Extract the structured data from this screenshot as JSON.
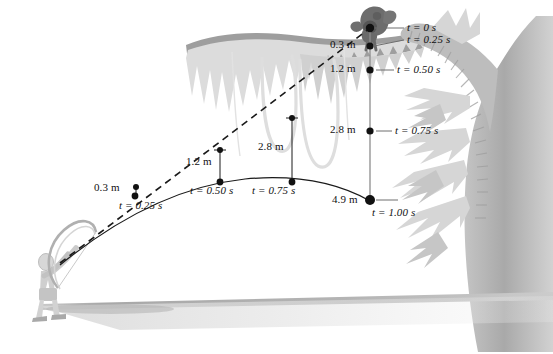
{
  "figure": {
    "ink_color": "#111111",
    "canopy_color": "#9a9a9a",
    "frond_color": "#d3d3d3",
    "trunk_color": "#b5b5b5",
    "ground_color": "#b9b9b9",
    "figure_color": "#c9c9c9",
    "monkey_color": "#6a6a6a",
    "vine_color": "#dcdcdc"
  },
  "monkey_drop": {
    "axis_label": "vertical fall of the monkey",
    "points": [
      {
        "distance": "",
        "time": "t = 0 s",
        "x": 370,
        "y": 28
      },
      {
        "distance": "0.3 m",
        "time": "t = 0.25 s",
        "x": 370,
        "y": 46
      },
      {
        "distance": "1.2 m",
        "time": "t = 0.50 s",
        "x": 370,
        "y": 70
      },
      {
        "distance": "2.8 m",
        "time": "t = 0.75 s",
        "x": 370,
        "y": 131
      },
      {
        "distance": "4.9 m",
        "time": "t = 1.00 s",
        "x": 370,
        "y": 200
      }
    ]
  },
  "arrow_path": {
    "axis_label": "trajectory of the arrow",
    "points": [
      {
        "time": "t = 0.25 s",
        "drop": "0.3 m",
        "x": 135,
        "y": 196
      },
      {
        "time": "t = 0.50 s",
        "drop": "1.2 m",
        "x": 220,
        "y": 182
      },
      {
        "time": "t = 0.75 s",
        "drop": "2.8 m",
        "x": 292,
        "y": 182
      },
      {
        "time": "t = 1.00 s",
        "drop": "4.9 m",
        "x": 370,
        "y": 200
      }
    ]
  },
  "aim_line": {
    "label": "line of sight / original aim direction",
    "style": "dashed"
  },
  "drop_brackets": [
    {
      "value": "1.2 m",
      "x": 220,
      "top": 150,
      "bottom": 182
    },
    {
      "value": "2.8 m",
      "x": 292,
      "top": 118,
      "bottom": 182
    }
  ],
  "labels": {
    "t0": "t = 0 s",
    "t025": "t = 0.25 s",
    "t050": "t = 0.50 s",
    "t075": "t = 0.75 s",
    "t100": "t = 1.00 s",
    "d03": "0.3 m",
    "d12": "1.2 m",
    "d28": "2.8 m",
    "d49": "4.9 m",
    "path_t025": "t = 0.25 s",
    "path_t050": "t = 0.50 s",
    "path_t075": "t = 0.75 s",
    "bracket_12": "1.2 m",
    "bracket_28": "2.8 m",
    "path_d03": "0.3 m"
  },
  "actors": {
    "archer": "archer with bow",
    "monkey": "monkey hanging from branch"
  }
}
